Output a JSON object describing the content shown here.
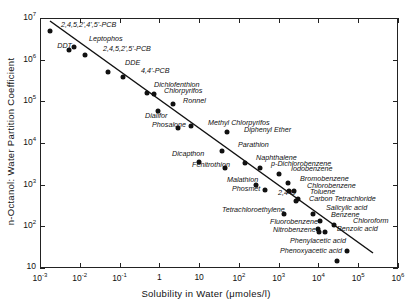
{
  "chart_data": {
    "type": "scatter",
    "title": "",
    "xlabel": "Solubility in Water (μmoles/l)",
    "ylabel": "n-Octanol: Water Partition Coefficient",
    "xscale": "log",
    "yscale": "log",
    "xlim": [
      0.001,
      1000000
    ],
    "ylim": [
      10,
      10000000
    ],
    "x_ticks": [
      {
        "base": "10",
        "exp": "-3"
      },
      {
        "base": "10",
        "exp": "-2"
      },
      {
        "base": "10",
        "exp": "-1"
      },
      {
        "base": "1",
        "exp": ""
      },
      {
        "base": "10",
        "exp": ""
      },
      {
        "base": "10",
        "exp": "2"
      },
      {
        "base": "10",
        "exp": "3"
      },
      {
        "base": "10",
        "exp": "4"
      },
      {
        "base": "10",
        "exp": "5"
      },
      {
        "base": "10",
        "exp": "6"
      }
    ],
    "y_ticks": [
      {
        "base": "10",
        "exp": "7"
      },
      {
        "base": "10",
        "exp": "6"
      },
      {
        "base": "10",
        "exp": "5"
      },
      {
        "base": "10",
        "exp": "4"
      },
      {
        "base": "10",
        "exp": "3"
      },
      {
        "base": "10",
        "exp": "2"
      },
      {
        "base": "10",
        "exp": ""
      }
    ],
    "grid": false,
    "legend": null,
    "regression_line": {
      "x_start": 0.0013,
      "y_start": 8500000,
      "x_end": 150000,
      "y_end": 23
    },
    "points": [
      {
        "name": "2,4,5,2',4',5'-PCB",
        "x": 0.0018,
        "y": 5000000,
        "lx": 61,
        "ly": 26
      },
      {
        "name": "DDT",
        "x": 0.0055,
        "y": 1700000,
        "lx": 50,
        "ly": 47,
        "anchor": "right"
      },
      {
        "name": "Leptophos",
        "x": 0.0072,
        "y": 2000000,
        "lx": 89,
        "ly": 40
      },
      {
        "name": "2,4,5,2',5'-PCB",
        "x": 0.0135,
        "y": 1300000,
        "lx": 103,
        "ly": 50
      },
      {
        "name": "DDE",
        "x": 0.05,
        "y": 500000,
        "lx": 125,
        "ly": 64
      },
      {
        "name": "4,4'-PCB",
        "x": 0.12,
        "y": 380000,
        "lx": 141,
        "ly": 72
      },
      {
        "name": "Dichlofenthion",
        "x": 0.48,
        "y": 160000,
        "lx": 154,
        "ly": 86
      },
      {
        "name": "Chlorpyrifos",
        "x": 0.72,
        "y": 150000,
        "lx": 164,
        "ly": 92
      },
      {
        "name": "Ronnel",
        "x": 2.2,
        "y": 85000,
        "lx": 183,
        "ly": 102
      },
      {
        "name": "Dialifor",
        "x": 0.95,
        "y": 60000,
        "lx": 145,
        "ly": 117
      },
      {
        "name": "Phosalone",
        "x": 2.9,
        "y": 23000,
        "lx": 152,
        "ly": 126
      },
      {
        "name": "Methyl Chlorpyrifos",
        "x": 6.3,
        "y": 25000,
        "lx": 208,
        "ly": 124
      },
      {
        "name": "Diphenyl Ether",
        "x": 50,
        "y": 18000,
        "lx": 244,
        "ly": 131
      },
      {
        "name": "Parathion",
        "x": 38,
        "y": 6400,
        "lx": 238,
        "ly": 146
      },
      {
        "name": "Dicapthon",
        "x": 10,
        "y": 3500,
        "lx": 172,
        "ly": 155
      },
      {
        "name": "Naphthalene",
        "x": 140,
        "y": 3300,
        "lx": 256,
        "ly": 159
      },
      {
        "name": "Fenitrothion",
        "x": 46,
        "y": 2500,
        "lx": 192,
        "ly": 166
      },
      {
        "name": "p-Dichlorobenzene",
        "x": 330,
        "y": 2500,
        "lx": 271,
        "ly": 165
      },
      {
        "name": "Iodobenzene",
        "x": 1020,
        "y": 1800,
        "lx": 291,
        "ly": 170
      },
      {
        "name": "Bromobenzene",
        "x": 1700,
        "y": 1100,
        "lx": 300,
        "ly": 180
      },
      {
        "name": "Malathion",
        "x": 270,
        "y": 1000,
        "lx": 227,
        "ly": 181
      },
      {
        "name": "2,4-D",
        "x": 1800,
        "y": 700,
        "lx": 278,
        "ly": 194
      },
      {
        "name": "Chlorobenzene",
        "x": 2500,
        "y": 700,
        "lx": 307,
        "ly": 187
      },
      {
        "name": "Phosmet",
        "x": 450,
        "y": 750,
        "lx": 232,
        "ly": 190
      },
      {
        "name": "Toluene",
        "x": 3000,
        "y": 450,
        "lx": 310,
        "ly": 193
      },
      {
        "name": "Carbon Tetrachloride",
        "x": 2800,
        "y": 400,
        "lx": 309,
        "ly": 200
      },
      {
        "name": "Tetrachloroethylene",
        "x": 1400,
        "y": 200,
        "lx": 222,
        "ly": 211
      },
      {
        "name": "Salicylic acid",
        "x": 7500,
        "y": 200,
        "lx": 326,
        "ly": 209
      },
      {
        "name": "Benzene",
        "x": 10700,
        "y": 135,
        "lx": 331,
        "ly": 216
      },
      {
        "name": "Chloroform",
        "x": 24000,
        "y": 110,
        "lx": 353,
        "ly": 222
      },
      {
        "name": "Fluorobenzene",
        "x": 9700,
        "y": 88,
        "lx": 270,
        "ly": 223
      },
      {
        "name": "Nitrobenzene",
        "x": 10300,
        "y": 74,
        "lx": 273,
        "ly": 231
      },
      {
        "name": "Benzoic acid",
        "x": 14400,
        "y": 74,
        "lx": 337,
        "ly": 230
      },
      {
        "name": "Phenylacetic acid",
        "x": 51000,
        "y": 25,
        "lx": 290,
        "ly": 242
      },
      {
        "name": "Phenoxyacetic acid",
        "x": 30000,
        "y": 15,
        "lx": 280,
        "ly": 252
      }
    ]
  }
}
